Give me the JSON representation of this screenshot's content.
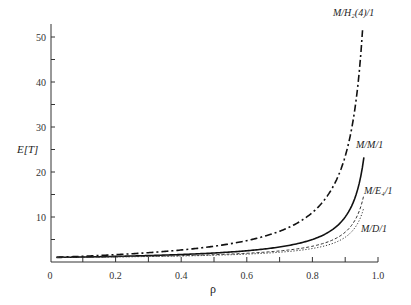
{
  "chart_data": {
    "type": "line",
    "title": "",
    "xlabel": "ρ",
    "ylabel": "E[T]",
    "xlim": [
      0,
      1.0
    ],
    "ylim": [
      0,
      52
    ],
    "grid": false,
    "legend": "inline labels at curve ends",
    "x_ticks": [
      "0",
      "0.2",
      "0.4",
      "0.6",
      "0.8",
      "1.0"
    ],
    "y_ticks": [
      "10",
      "20",
      "30",
      "40",
      "50"
    ],
    "x": [
      0,
      0.1,
      0.2,
      0.3,
      0.4,
      0.5,
      0.6,
      0.7,
      0.8,
      0.9,
      0.92,
      0.94,
      0.95,
      0.957
    ],
    "series": [
      {
        "name": "M/H2(4)/1",
        "style": "dash-dot",
        "values": [
          1,
          1.28,
          1.63,
          2.07,
          2.67,
          3.5,
          4.75,
          6.83,
          11,
          23.5,
          29.75,
          40.17,
          48.5,
          51.5
        ]
      },
      {
        "name": "M/M/1",
        "style": "solid",
        "values": [
          1,
          1.11,
          1.25,
          1.43,
          1.67,
          2,
          2.5,
          3.33,
          5,
          10,
          12.5,
          16.67,
          20,
          23.3
        ]
      },
      {
        "name": "M/E4/1",
        "style": "dashed",
        "values": [
          1,
          1.07,
          1.16,
          1.27,
          1.42,
          1.63,
          1.94,
          2.46,
          3.5,
          6.63,
          8.19,
          10.79,
          12.88,
          14.9
        ]
      },
      {
        "name": "M/D/1",
        "style": "dotted",
        "values": [
          1,
          1.06,
          1.13,
          1.21,
          1.33,
          1.5,
          1.75,
          2.17,
          3,
          5.5,
          6.75,
          8.83,
          10.5,
          12.1
        ]
      }
    ]
  },
  "labels": {
    "ylabel": "E[T]",
    "xlabel": "ρ",
    "h2": "M/H₂(4)/1",
    "mm1": "M/M/1",
    "e4": "M/E₄/1",
    "md1": "M/D/1"
  }
}
